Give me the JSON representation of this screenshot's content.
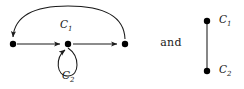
{
  "figure": {
    "conjunction": "and",
    "stroke_color": "#1a1a1a",
    "node_color": "#000000",
    "background_color": "#ffffff"
  },
  "left_graph": {
    "name": "three-vertex-digraph-with-cycles",
    "nodes": [
      {
        "id": "v1",
        "x": 13,
        "y": 44,
        "r": 3.2
      },
      {
        "id": "v2",
        "x": 68,
        "y": 44,
        "r": 3.2
      },
      {
        "id": "v3",
        "x": 125,
        "y": 44,
        "r": 3.2
      }
    ],
    "edges": [
      {
        "id": "e1",
        "from": "v1",
        "to": "v2",
        "kind": "straight-arrow"
      },
      {
        "id": "e2",
        "from": "v2",
        "to": "v3",
        "kind": "straight-arrow"
      },
      {
        "id": "e3",
        "from": "v3",
        "to": "v1",
        "kind": "arc-over-top"
      },
      {
        "id": "e4",
        "from": "v2",
        "to": "v2",
        "kind": "self-loop-below"
      }
    ],
    "labels": {
      "arc": {
        "base": "C",
        "sub": "1",
        "x": 60,
        "y": 18
      },
      "loop": {
        "base": "C",
        "sub": "2",
        "x": 62,
        "y": 69
      }
    }
  },
  "right_graph": {
    "name": "two-vertex-segment",
    "nodes": [
      {
        "id": "u1",
        "x": 207,
        "y": 21,
        "r": 3.2
      },
      {
        "id": "u2",
        "x": 207,
        "y": 71,
        "r": 3.2
      }
    ],
    "edges": [
      {
        "id": "f1",
        "from": "u1",
        "to": "u2",
        "kind": "plain-segment"
      }
    ],
    "labels": {
      "top": {
        "base": "C",
        "sub": "1",
        "x": 219,
        "y": 13
      },
      "bottom": {
        "base": "C",
        "sub": "2",
        "x": 219,
        "y": 63
      }
    }
  }
}
